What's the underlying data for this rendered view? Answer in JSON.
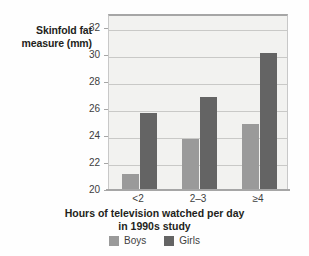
{
  "chart_data": {
    "type": "bar",
    "title": "",
    "subtitle": "",
    "categories": [
      "<2",
      "2–3",
      "≥4"
    ],
    "series": [
      {
        "name": "Boys",
        "color": "#9a9a9a",
        "values": [
          21.2,
          23.8,
          24.9
        ]
      },
      {
        "name": "Girls",
        "color": "#646464",
        "values": [
          25.7,
          26.9,
          30.1
        ]
      }
    ],
    "xlabel": "Hours of television watched per day in 1990s study",
    "ylabel": "Skinfold fat measure (mm)",
    "ylim": [
      20,
      33
    ],
    "yticks": [
      20,
      22,
      24,
      26,
      28,
      30,
      32
    ],
    "ytick_labels": [
      "20",
      "22",
      "24",
      "26",
      "28",
      "30",
      "32"
    ],
    "grid": true,
    "legend_position": "bottom"
  },
  "axes": {
    "y_title_line1": "Skinfold fat",
    "y_title_line2": "measure (mm)",
    "x_title_line1": "Hours of television watched per day",
    "x_title_line2": "in 1990s study"
  },
  "legend": {
    "entries": [
      {
        "label": "Boys",
        "swatch": "boys-swatch"
      },
      {
        "label": "Girls",
        "swatch": "girls-swatch"
      }
    ]
  }
}
